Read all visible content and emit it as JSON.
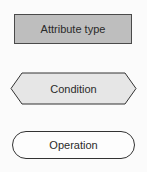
{
  "legend": {
    "items": [
      {
        "shape": "rectangle",
        "label": "Attribute type",
        "fill": "#bebebe",
        "stroke": "#4a4a4a"
      },
      {
        "shape": "hexagon",
        "label": "Condition",
        "fill": "#e6e6e6",
        "stroke": "#333333"
      },
      {
        "shape": "rounded-pill",
        "label": "Operation",
        "fill": "#fdfdfd",
        "stroke": "#333333"
      }
    ]
  }
}
